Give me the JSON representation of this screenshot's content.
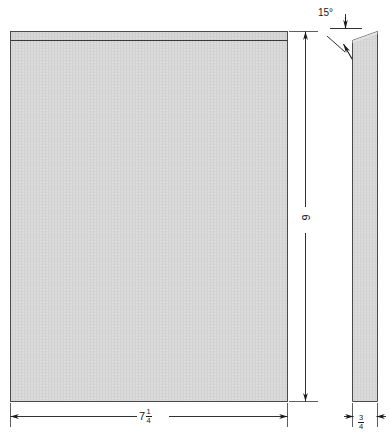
{
  "drawing": {
    "title": "Beveled panel orthographic drawing",
    "background_color": "#ffffff",
    "line_color": "#1a1a1a",
    "fill_color": "#d8d8d8",
    "hatch_color": "#c4c4c4"
  },
  "views": {
    "front": {
      "name": "front-view",
      "bevel_band_label": "beveled top edge band"
    },
    "side": {
      "name": "side-view",
      "bevel_label": "beveled top edge"
    }
  },
  "dimensions": {
    "height": {
      "name": "height-dimension",
      "value": "9",
      "orientation": "vertical"
    },
    "width": {
      "name": "width-dimension",
      "whole": "7",
      "numerator": "1",
      "denominator": "4",
      "display": "7 1/4",
      "orientation": "horizontal"
    },
    "thickness": {
      "name": "thickness-dimension",
      "whole": "",
      "numerator": "3",
      "denominator": "4",
      "display": "3/4",
      "orientation": "horizontal"
    },
    "bevel_angle": {
      "name": "bevel-angle-dimension",
      "value": "15",
      "unit_symbol": "°",
      "display": "15°"
    }
  }
}
